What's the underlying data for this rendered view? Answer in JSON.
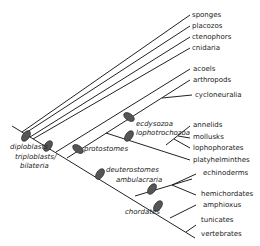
{
  "colors": {
    "line": "#222222",
    "node": "#555555",
    "text": "#222222"
  },
  "taxa": {
    "sponges": "sponges",
    "placozos": "placozos",
    "ctenophors": "ctenophors",
    "cnidaria": "cnidaria",
    "acoels": "acoels",
    "arthropods": "arthropods",
    "cycloneuralia": "cycloneuralia",
    "annelids": "annelids",
    "mollusks": "mollusks",
    "lophophorates": "lophophorates",
    "platyhelminthes": "platyhelminthes",
    "echinoderms": "echinoderms",
    "hemichordates": "hemichordates",
    "amphioxus": "amphioxus",
    "tunicates": "tunicates",
    "vertebrates": "vertebrates"
  },
  "clades": {
    "diploblasts": "diploblasts",
    "triploblasts": "triploblasts/",
    "bilateria": "bilateria",
    "protostomes": "protostomes",
    "ecdysozoa": "ecdysozoa",
    "lophotrochozoa": "lophotrochozoa",
    "deuterostomes": "deuterostomes",
    "ambulacraria": "ambulacraria",
    "chordates": "chordates"
  }
}
